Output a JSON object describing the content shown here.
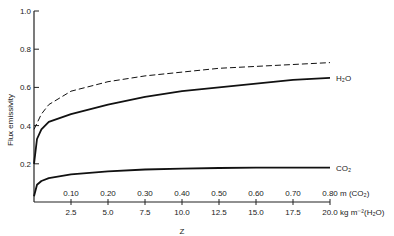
{
  "chart_data": {
    "type": "line",
    "title": "",
    "ylabel": "Flux emissivity",
    "xlabel": "Z",
    "ylim": [
      0,
      1.0
    ],
    "yticks": [
      "0.2",
      "0.4",
      "0.6",
      "0.8",
      "1.0"
    ],
    "xaxis_top_ticks": [
      "0.10",
      "0.20",
      "0.30",
      "0.40",
      "0.50",
      "0.60",
      "0.70",
      "0.80"
    ],
    "xaxis_top_unit": "m (CO₂)",
    "xaxis_bottom_ticks": [
      "2.5",
      "5.0",
      "7.5",
      "10.0",
      "12.5",
      "15.0",
      "17.5",
      "20.0"
    ],
    "xaxis_bottom_unit": "kg m⁻²(H₂O)",
    "xlim": [
      0,
      20.0
    ],
    "grid": false,
    "series": [
      {
        "name": "dashed (H₂O + CO₂ combined)",
        "style": "dashed",
        "label": "",
        "x": [
          0,
          0.5,
          1,
          2.5,
          5,
          7.5,
          10,
          12.5,
          15,
          17.5,
          20
        ],
        "values": [
          0.38,
          0.46,
          0.51,
          0.58,
          0.63,
          0.66,
          0.68,
          0.7,
          0.71,
          0.72,
          0.73
        ]
      },
      {
        "name": "H₂O",
        "style": "solid",
        "label": "H₂O",
        "x": [
          0,
          0.2,
          0.5,
          1,
          2.5,
          5,
          7.5,
          10,
          12.5,
          15,
          17.5,
          20
        ],
        "values": [
          0.2,
          0.33,
          0.38,
          0.42,
          0.46,
          0.51,
          0.55,
          0.58,
          0.6,
          0.62,
          0.64,
          0.65
        ]
      },
      {
        "name": "CO₂",
        "style": "solid",
        "label": "CO₂",
        "x": [
          0,
          0.2,
          0.5,
          1,
          2.5,
          5,
          7.5,
          10,
          12.5,
          15,
          17.5,
          20
        ],
        "values": [
          0.03,
          0.09,
          0.11,
          0.125,
          0.145,
          0.16,
          0.17,
          0.175,
          0.178,
          0.18,
          0.18,
          0.18
        ]
      }
    ],
    "legend": "inline labels at right end of curves"
  }
}
